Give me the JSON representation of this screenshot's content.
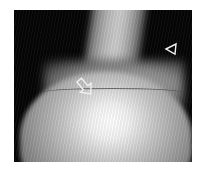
{
  "image": {
    "description": "Grayscale radiographic / sonographic image of a rounded bony head with a shaft, black background",
    "background_color": "#050505",
    "annotations": [
      {
        "type": "open-arrow",
        "position": "left-center, pointing down-right at curved line"
      },
      {
        "type": "open-arrowhead",
        "position": "upper right, pointing left at shaft edge"
      }
    ]
  }
}
